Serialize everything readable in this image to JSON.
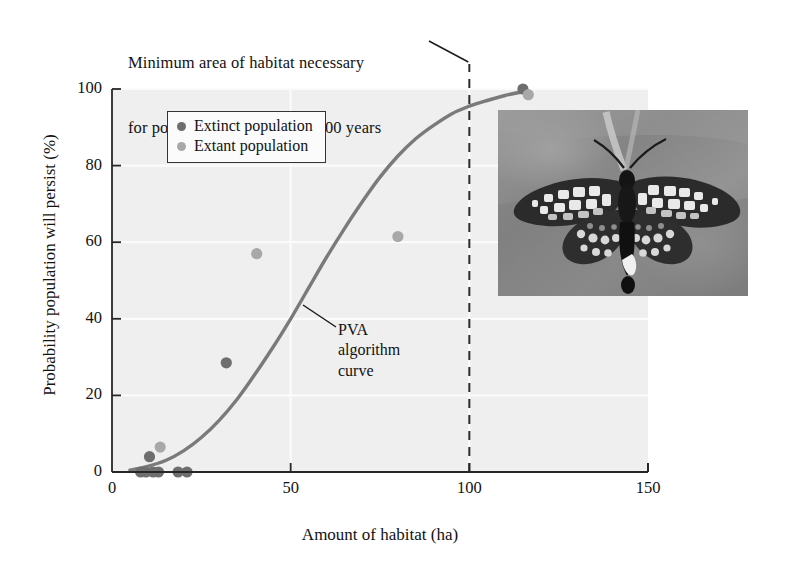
{
  "figure": {
    "top_caption_line1": "Minimum area of habitat necessary",
    "top_caption_line2": "for population to persist for 100 years",
    "pva_annotation_line1": "PVA",
    "pva_annotation_line2": "algorithm",
    "pva_annotation_line3": "curve",
    "photo_alt": "butterfly-photo"
  },
  "legend": {
    "items": [
      {
        "label": "Extinct population",
        "color": "#6e6e6e"
      },
      {
        "label": "Extant population",
        "color": "#a8a8a8"
      }
    ]
  },
  "colors": {
    "plot_background": "#efefef",
    "axis": "#262626",
    "gridline": "#fbfbfb",
    "curve": "#7a7a7a",
    "dashed_line": "#2a2a2a",
    "extinct": "#6e6e6e",
    "extant": "#a8a8a8",
    "text": "#121212"
  },
  "chart_data": {
    "type": "scatter",
    "title": "",
    "xlabel": "Amount of habitat (ha)",
    "ylabel": "Probability population will persist (%)",
    "xlim": [
      0,
      150
    ],
    "ylim": [
      0,
      100
    ],
    "xticks": [
      0,
      50,
      100,
      150
    ],
    "yticks": [
      0,
      20,
      40,
      60,
      80,
      100
    ],
    "grid": true,
    "legend_position": "top-left",
    "series": [
      {
        "name": "Extinct population",
        "color": "#6e6e6e",
        "points": [
          {
            "x": 8.0,
            "y": 0.0
          },
          {
            "x": 9.5,
            "y": 0.0
          },
          {
            "x": 10.5,
            "y": 4.0
          },
          {
            "x": 11.5,
            "y": 0.0
          },
          {
            "x": 13.0,
            "y": 0.0
          },
          {
            "x": 18.5,
            "y": 0.0
          },
          {
            "x": 21.0,
            "y": 0.0
          },
          {
            "x": 32.0,
            "y": 28.5
          },
          {
            "x": 115.0,
            "y": 100.0
          }
        ]
      },
      {
        "name": "Extant population",
        "color": "#a8a8a8",
        "points": [
          {
            "x": 13.5,
            "y": 6.5
          },
          {
            "x": 40.5,
            "y": 57.0
          },
          {
            "x": 80.0,
            "y": 61.5
          },
          {
            "x": 116.5,
            "y": 98.5
          }
        ]
      }
    ],
    "curve": {
      "name": "PVA algorithm curve",
      "color": "#7a7a7a",
      "points": [
        {
          "x": 5,
          "y": 0.5
        },
        {
          "x": 10,
          "y": 1.5
        },
        {
          "x": 15,
          "y": 3.0
        },
        {
          "x": 20,
          "y": 5.5
        },
        {
          "x": 25,
          "y": 9.0
        },
        {
          "x": 30,
          "y": 13.5
        },
        {
          "x": 35,
          "y": 19.0
        },
        {
          "x": 40,
          "y": 25.5
        },
        {
          "x": 45,
          "y": 32.5
        },
        {
          "x": 50,
          "y": 40.0
        },
        {
          "x": 55,
          "y": 48.0
        },
        {
          "x": 60,
          "y": 56.0
        },
        {
          "x": 65,
          "y": 63.5
        },
        {
          "x": 70,
          "y": 70.5
        },
        {
          "x": 75,
          "y": 77.0
        },
        {
          "x": 80,
          "y": 82.5
        },
        {
          "x": 85,
          "y": 87.0
        },
        {
          "x": 90,
          "y": 90.5
        },
        {
          "x": 95,
          "y": 93.5
        },
        {
          "x": 100,
          "y": 95.5
        },
        {
          "x": 105,
          "y": 97.0
        },
        {
          "x": 110,
          "y": 98.3
        },
        {
          "x": 115,
          "y": 99.3
        }
      ]
    },
    "reference_line": {
      "label": "Minimum area of habitat necessary for population to persist for 100 years",
      "x": 100,
      "style": "dashed",
      "color": "#2a2a2a"
    },
    "annotations": [
      {
        "text": "PVA algorithm curve",
        "x": 62,
        "y": 36
      }
    ]
  }
}
